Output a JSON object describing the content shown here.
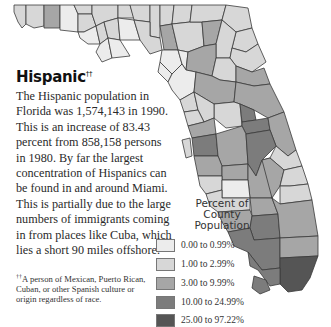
{
  "map": {
    "region": "Florida",
    "stroke_color": "#3a3a3a",
    "county_colors": {
      "c0": "#ececec",
      "c1": "#d7d7d7",
      "c2": "#a6a6a6",
      "c3": "#7c7c7c",
      "c4": "#555555"
    }
  },
  "heading": {
    "title": "Hispanic",
    "marker": "††"
  },
  "body": {
    "paragraph": "The Hispanic population in Florida was 1,574,143 in 1990. This is an increase of 83.43 percent from 858,158 persons in 1980. By far the largest concentration of Hispanics can be found in and around Miami. This is partially due to the large numbers of immigrants coming in from places like Cuba, which lies a short 90 miles offshore."
  },
  "footnote": {
    "marker": "††",
    "text": "A person of Mexican, Puerto Rican, Cuban, or other Spanish culture or origin regardless of race."
  },
  "legend": {
    "title_line1": "Percent of",
    "title_line2": "County",
    "title_line3": "Population",
    "items": [
      {
        "label": "0.00 to 0.99%",
        "color": "#ececec"
      },
      {
        "label": "1.00 to 2.99%",
        "color": "#d7d7d7"
      },
      {
        "label": "3.00 to 9.99%",
        "color": "#a6a6a6"
      },
      {
        "label": "10.00 to 24.99%",
        "color": "#7c7c7c"
      },
      {
        "label": "25.00 to 97.22%",
        "color": "#555555"
      }
    ]
  }
}
